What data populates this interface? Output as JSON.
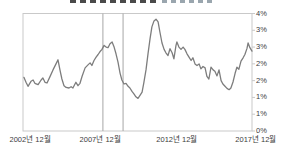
{
  "window": {
    "description": "small line chart, title clipped at top edge of screenshot"
  },
  "colors": {
    "series_line": "#7d7d7d",
    "event_line": "#a6a6a6",
    "plot_border": "#c9c9c9",
    "tick_label": "#3c3c3c",
    "title_remnant_dark": "#4a4a4a",
    "title_remnant_light": "#9aa6ae",
    "background": "#ffffff"
  },
  "chart_data": {
    "type": "line",
    "title": "",
    "title_clipped": true,
    "xlabel": "",
    "ylabel": "",
    "ylim": [
      0,
      3.5
    ],
    "grid": false,
    "legend": false,
    "y_axis_side": "right",
    "y_ticks": [
      {
        "label": "4%",
        "value": 3.5
      },
      {
        "label": "3%",
        "value": 3.0
      },
      {
        "label": "3%",
        "value": 2.5
      },
      {
        "label": "2%",
        "value": 2.0
      },
      {
        "label": "2%",
        "value": 1.5
      },
      {
        "label": "1%",
        "value": 1.0
      },
      {
        "label": "1%",
        "value": 0.5
      },
      {
        "label": "0%",
        "value": 0.0
      }
    ],
    "x_ticks": [
      {
        "label": "2002년 12월",
        "frac": 0.031
      },
      {
        "label": "2007년 12월",
        "frac": 0.337
      },
      {
        "label": "2012년 12월",
        "frac": 0.672
      },
      {
        "label": "2017년 12월",
        "frac": 1.017
      }
    ],
    "x_range": [
      "2002-12",
      "2017-12"
    ],
    "event_vlines": [
      {
        "frac": 0.349
      },
      {
        "frac": 0.437
      }
    ],
    "series": [
      {
        "name": "rate-percent",
        "points": [
          [
            0.004,
            1.6
          ],
          [
            0.013,
            1.45
          ],
          [
            0.022,
            1.33
          ],
          [
            0.035,
            1.48
          ],
          [
            0.044,
            1.52
          ],
          [
            0.052,
            1.42
          ],
          [
            0.066,
            1.38
          ],
          [
            0.079,
            1.52
          ],
          [
            0.087,
            1.58
          ],
          [
            0.096,
            1.45
          ],
          [
            0.105,
            1.43
          ],
          [
            0.118,
            1.62
          ],
          [
            0.131,
            1.82
          ],
          [
            0.144,
            2.0
          ],
          [
            0.153,
            2.12
          ],
          [
            0.162,
            1.8
          ],
          [
            0.17,
            1.55
          ],
          [
            0.179,
            1.35
          ],
          [
            0.188,
            1.3
          ],
          [
            0.201,
            1.28
          ],
          [
            0.21,
            1.32
          ],
          [
            0.218,
            1.28
          ],
          [
            0.231,
            1.45
          ],
          [
            0.24,
            1.35
          ],
          [
            0.249,
            1.42
          ],
          [
            0.258,
            1.63
          ],
          [
            0.271,
            1.88
          ],
          [
            0.284,
            1.97
          ],
          [
            0.293,
            2.03
          ],
          [
            0.301,
            1.95
          ],
          [
            0.31,
            2.1
          ],
          [
            0.319,
            2.2
          ],
          [
            0.328,
            2.28
          ],
          [
            0.336,
            2.36
          ],
          [
            0.345,
            2.43
          ],
          [
            0.354,
            2.55
          ],
          [
            0.363,
            2.5
          ],
          [
            0.371,
            2.48
          ],
          [
            0.38,
            2.6
          ],
          [
            0.389,
            2.65
          ],
          [
            0.397,
            2.52
          ],
          [
            0.406,
            2.3
          ],
          [
            0.415,
            2.05
          ],
          [
            0.424,
            1.72
          ],
          [
            0.432,
            1.52
          ],
          [
            0.441,
            1.4
          ],
          [
            0.45,
            1.42
          ],
          [
            0.459,
            1.33
          ],
          [
            0.467,
            1.28
          ],
          [
            0.476,
            1.18
          ],
          [
            0.485,
            1.1
          ],
          [
            0.493,
            1.02
          ],
          [
            0.502,
            0.97
          ],
          [
            0.511,
            1.06
          ],
          [
            0.52,
            1.16
          ],
          [
            0.528,
            1.45
          ],
          [
            0.537,
            1.82
          ],
          [
            0.546,
            2.3
          ],
          [
            0.555,
            2.76
          ],
          [
            0.563,
            3.1
          ],
          [
            0.572,
            3.28
          ],
          [
            0.581,
            3.33
          ],
          [
            0.59,
            3.25
          ],
          [
            0.598,
            2.95
          ],
          [
            0.607,
            2.62
          ],
          [
            0.616,
            2.43
          ],
          [
            0.624,
            2.33
          ],
          [
            0.633,
            2.25
          ],
          [
            0.642,
            2.45
          ],
          [
            0.651,
            2.33
          ],
          [
            0.659,
            2.15
          ],
          [
            0.668,
            2.55
          ],
          [
            0.672,
            2.65
          ],
          [
            0.681,
            2.5
          ],
          [
            0.69,
            2.43
          ],
          [
            0.699,
            2.5
          ],
          [
            0.707,
            2.43
          ],
          [
            0.716,
            2.3
          ],
          [
            0.725,
            2.2
          ],
          [
            0.734,
            2.1
          ],
          [
            0.742,
            2.18
          ],
          [
            0.751,
            2.0
          ],
          [
            0.76,
            1.95
          ],
          [
            0.769,
            2.0
          ],
          [
            0.777,
            1.85
          ],
          [
            0.786,
            1.92
          ],
          [
            0.795,
            1.88
          ],
          [
            0.803,
            1.63
          ],
          [
            0.812,
            1.55
          ],
          [
            0.821,
            1.9
          ],
          [
            0.83,
            1.82
          ],
          [
            0.838,
            1.78
          ],
          [
            0.847,
            1.64
          ],
          [
            0.856,
            1.82
          ],
          [
            0.865,
            1.5
          ],
          [
            0.873,
            1.4
          ],
          [
            0.882,
            1.33
          ],
          [
            0.891,
            1.27
          ],
          [
            0.9,
            1.23
          ],
          [
            0.908,
            1.28
          ],
          [
            0.917,
            1.46
          ],
          [
            0.926,
            1.72
          ],
          [
            0.934,
            1.9
          ],
          [
            0.943,
            1.84
          ],
          [
            0.952,
            2.08
          ],
          [
            0.961,
            2.18
          ],
          [
            0.969,
            2.28
          ],
          [
            0.978,
            2.46
          ],
          [
            0.983,
            2.62
          ],
          [
            0.991,
            2.48
          ],
          [
            1.0,
            2.38
          ]
        ]
      }
    ]
  }
}
